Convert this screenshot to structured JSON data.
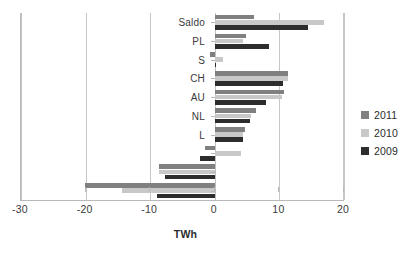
{
  "chart_data": {
    "type": "bar",
    "orientation": "horizontal",
    "title": "",
    "xlabel": "TWh",
    "ylabel": "",
    "xlim": [
      -30,
      20
    ],
    "xticks": [
      -30,
      -20,
      -10,
      0,
      10,
      20
    ],
    "xtick_labels": [
      "-30",
      "-20",
      "-10",
      "0",
      "10",
      "20"
    ],
    "grid": true,
    "legend_position": "right",
    "categories": [
      "Saldo",
      "PL",
      "S",
      "CH",
      "AU",
      "NL",
      "L",
      "",
      "",
      ""
    ],
    "series": [
      {
        "name": "2011",
        "color": "#808080",
        "values": [
          6.0,
          4.9,
          -0.7,
          11.3,
          10.7,
          6.4,
          4.7,
          -1.5,
          -8.7,
          -20.1
        ]
      },
      {
        "name": "2010",
        "color": "#c8c8c8",
        "values": [
          16.9,
          4.4,
          1.3,
          11.3,
          10.4,
          5.6,
          4.4,
          4.0,
          -8.7,
          -14.3
        ]
      },
      {
        "name": "2009",
        "color": "#2d2d2d",
        "values": [
          14.4,
          8.4,
          0.2,
          10.5,
          8.0,
          5.4,
          4.3,
          -2.3,
          -7.7,
          -9.0
        ]
      }
    ]
  },
  "legend": {
    "items": [
      {
        "label": "2011",
        "color": "#808080"
      },
      {
        "label": "2010",
        "color": "#c8c8c8"
      },
      {
        "label": "2009",
        "color": "#2d2d2d"
      }
    ]
  }
}
